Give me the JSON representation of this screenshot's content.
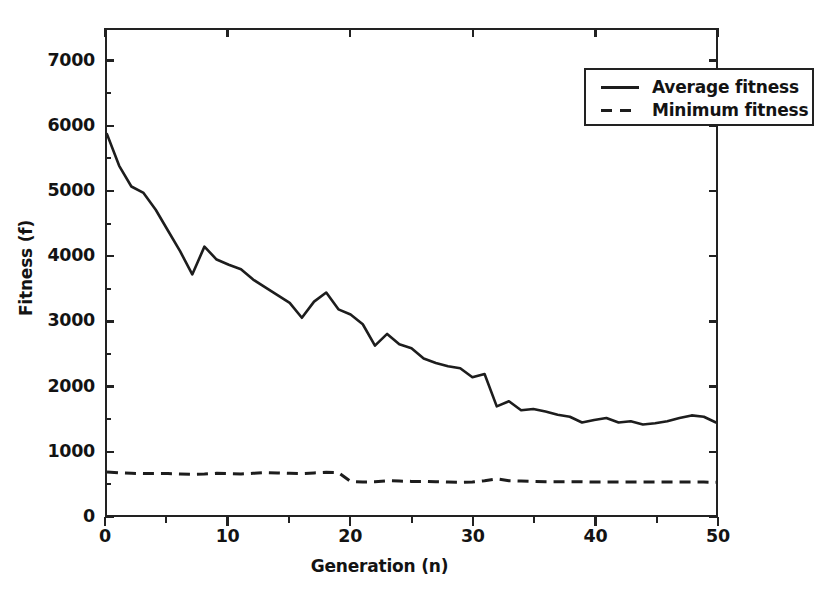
{
  "chart_data": {
    "type": "line",
    "title": "",
    "xlabel": "Generation (n)",
    "ylabel": "Fitness (f)",
    "xlim": [
      0,
      50
    ],
    "ylim": [
      0,
      7500
    ],
    "xticks": [
      0,
      10,
      20,
      30,
      40,
      50
    ],
    "yticks": [
      0,
      1000,
      2000,
      3000,
      4000,
      5000,
      6000,
      7000
    ],
    "xtick_labels": [
      "0",
      "10",
      "20",
      "30",
      "40",
      "50"
    ],
    "ytick_labels": [
      "0",
      "1000",
      "2000",
      "3000",
      "4000",
      "5000",
      "6000",
      "7000"
    ],
    "grid": false,
    "legend_position": "upper right",
    "x": [
      0,
      1,
      2,
      3,
      4,
      5,
      6,
      7,
      8,
      9,
      10,
      11,
      12,
      13,
      14,
      15,
      16,
      17,
      18,
      19,
      20,
      21,
      22,
      23,
      24,
      25,
      26,
      27,
      28,
      29,
      30,
      31,
      32,
      33,
      34,
      35,
      36,
      37,
      38,
      39,
      40,
      41,
      42,
      43,
      44,
      45,
      46,
      47,
      48,
      49,
      50
    ],
    "series": [
      {
        "name": "Average fitness",
        "style": "solid",
        "color": "#1d1d1d",
        "values": [
          5890,
          5400,
          5080,
          4980,
          4720,
          4400,
          4080,
          3720,
          4150,
          3950,
          3870,
          3800,
          3640,
          3520,
          3400,
          3280,
          3050,
          3300,
          3440,
          3180,
          3100,
          2950,
          2620,
          2800,
          2640,
          2580,
          2420,
          2350,
          2300,
          2270,
          2130,
          2180,
          1680,
          1760,
          1620,
          1640,
          1600,
          1550,
          1520,
          1430,
          1470,
          1500,
          1430,
          1450,
          1400,
          1420,
          1450,
          1500,
          1540,
          1520,
          1430
        ]
      },
      {
        "name": "Minimum fitness",
        "style": "dashed",
        "color": "#1d1d1d",
        "values": [
          665,
          650,
          645,
          640,
          640,
          640,
          635,
          630,
          635,
          645,
          640,
          635,
          645,
          655,
          650,
          645,
          640,
          650,
          660,
          655,
          520,
          510,
          515,
          530,
          525,
          520,
          520,
          515,
          510,
          505,
          510,
          530,
          560,
          530,
          525,
          520,
          515,
          515,
          515,
          515,
          510,
          510,
          510,
          510,
          510,
          510,
          510,
          510,
          510,
          510,
          505
        ]
      }
    ]
  },
  "legend": {
    "items": [
      {
        "label": "Average fitness",
        "style": "solid"
      },
      {
        "label": "Minimum fitness",
        "style": "dashed"
      }
    ]
  }
}
